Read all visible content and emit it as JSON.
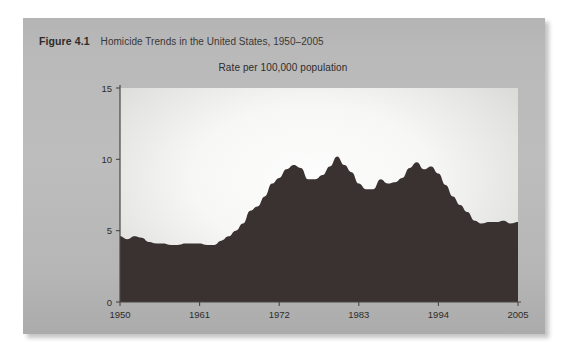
{
  "figure": {
    "label": "Figure 4.1",
    "title": "Homicide Trends in the United States, 1950–2005"
  },
  "chart_data": {
    "type": "area",
    "title": "Homicide Trends in the United States, 1950–2005",
    "subtitle": "Rate per 100,000 population",
    "xlabel": "",
    "ylabel": "Rate per 100,000 population",
    "xlim": [
      1950,
      2005
    ],
    "ylim": [
      0,
      15
    ],
    "grid": false,
    "legend": null,
    "series_color": "#3a3230",
    "xticks": [
      "1950",
      "1961",
      "1972",
      "1983",
      "1994",
      "2005"
    ],
    "yticks": [
      "0",
      "5",
      "10",
      "15"
    ],
    "x": [
      1950,
      1951,
      1952,
      1953,
      1954,
      1955,
      1956,
      1957,
      1958,
      1959,
      1960,
      1961,
      1962,
      1963,
      1964,
      1965,
      1966,
      1967,
      1968,
      1969,
      1970,
      1971,
      1972,
      1973,
      1974,
      1975,
      1976,
      1977,
      1978,
      1979,
      1980,
      1981,
      1982,
      1983,
      1984,
      1985,
      1986,
      1987,
      1988,
      1989,
      1990,
      1991,
      1992,
      1993,
      1994,
      1995,
      1996,
      1997,
      1998,
      1999,
      2000,
      2001,
      2002,
      2003,
      2004,
      2005
    ],
    "values": [
      4.6,
      4.4,
      4.6,
      4.5,
      4.2,
      4.1,
      4.1,
      4.0,
      4.0,
      4.1,
      4.1,
      4.1,
      4.0,
      4.0,
      4.3,
      4.6,
      5.0,
      5.5,
      6.4,
      6.7,
      7.4,
      8.3,
      8.7,
      9.3,
      9.6,
      9.4,
      8.6,
      8.6,
      8.9,
      9.5,
      10.2,
      9.6,
      9.1,
      8.3,
      7.9,
      7.9,
      8.6,
      8.3,
      8.4,
      8.7,
      9.4,
      9.8,
      9.3,
      9.5,
      9.0,
      8.2,
      7.4,
      6.8,
      6.3,
      5.7,
      5.5,
      5.6,
      5.6,
      5.7,
      5.5,
      5.6
    ]
  }
}
